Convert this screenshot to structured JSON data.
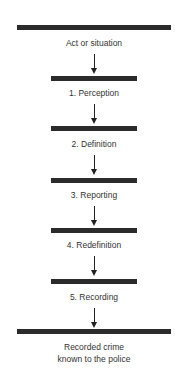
{
  "diagram": {
    "type": "vertical-flowchart",
    "start": {
      "label": "Act or situation"
    },
    "stages": [
      {
        "label": "1. Perception"
      },
      {
        "label": "2. Definition"
      },
      {
        "label": "3. Reporting"
      },
      {
        "label": "4. Redefinition"
      },
      {
        "label": "5. Recording"
      }
    ],
    "end": {
      "label_line1": "Recorded crime",
      "label_line2": "known to the police"
    },
    "colors": {
      "bar": "#2b2b2b",
      "text": "#333333",
      "arrow": "#222222"
    }
  }
}
